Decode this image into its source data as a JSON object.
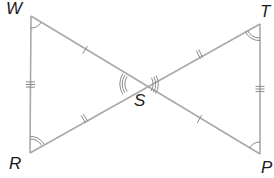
{
  "diagram": {
    "type": "bowtie-congruent-triangles",
    "colors": {
      "line": "#a9a9a9",
      "mark": "#8a8a8a",
      "label": "#1a1a1a",
      "background": "#ffffff"
    },
    "points": {
      "W": {
        "x": 31,
        "y": 16,
        "label": "W",
        "lx": 6,
        "ly": 0
      },
      "T": {
        "x": 260,
        "y": 24,
        "label": "T",
        "lx": 260,
        "ly": 3
      },
      "R": {
        "x": 30,
        "y": 153,
        "label": "R",
        "lx": 9,
        "ly": 155
      },
      "P": {
        "x": 260,
        "y": 154,
        "label": "P",
        "lx": 261,
        "ly": 159
      },
      "S": {
        "x": 139,
        "y": 84,
        "label": "S",
        "lx": 134,
        "ly": 92
      }
    },
    "segments": [
      {
        "from": "W",
        "to": "P",
        "name": "segment-wp"
      },
      {
        "from": "R",
        "to": "T",
        "name": "segment-rt"
      },
      {
        "from": "W",
        "to": "R",
        "name": "segment-wr"
      },
      {
        "from": "T",
        "to": "P",
        "name": "segment-tp"
      }
    ],
    "tick_marks": [
      {
        "segment": "WS",
        "count": 1
      },
      {
        "segment": "SP",
        "count": 1
      },
      {
        "segment": "RS",
        "count": 2
      },
      {
        "segment": "ST",
        "count": 2
      },
      {
        "segment": "WR",
        "count": 3
      },
      {
        "segment": "TP",
        "count": 3
      }
    ],
    "angle_marks": [
      {
        "vertex": "W",
        "arcs": 1
      },
      {
        "vertex": "P",
        "arcs": 1
      },
      {
        "vertex": "R",
        "arcs": 2
      },
      {
        "vertex": "T",
        "arcs": 2
      },
      {
        "vertex": "S",
        "side": "left",
        "arcs": 3
      },
      {
        "vertex": "S",
        "side": "right",
        "arcs": 3
      }
    ]
  }
}
